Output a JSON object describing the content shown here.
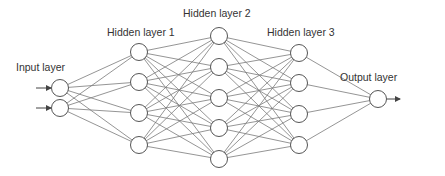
{
  "colors": {
    "background": "#ffffff",
    "node_stroke": "#555555",
    "node_fill": "#ffffff",
    "edge": "#7a7a7a",
    "text": "#333333"
  },
  "layers": [
    {
      "name": "Input layer",
      "x": 60,
      "ys": [
        88,
        108
      ],
      "label_x": 16,
      "label_y": 71
    },
    {
      "name": "Hidden layer 1",
      "x": 139,
      "ys": [
        52,
        82,
        113,
        145
      ],
      "label_x": 107,
      "label_y": 36
    },
    {
      "name": "Hidden layer 2",
      "x": 219,
      "ys": [
        36,
        67,
        98,
        128,
        159
      ],
      "label_x": 183,
      "label_y": 17
    },
    {
      "name": "Hidden layer 3",
      "x": 299,
      "ys": [
        53,
        83,
        114,
        145
      ],
      "label_x": 267,
      "label_y": 36
    },
    {
      "name": "Output layer",
      "x": 378,
      "ys": [
        99
      ],
      "label_x": 340,
      "label_y": 81
    }
  ],
  "node_radius": 8.5,
  "input_arrows": [
    {
      "x1": 36,
      "x2": 51,
      "y": 88
    },
    {
      "x1": 36,
      "x2": 51,
      "y": 108
    }
  ],
  "output_arrow": {
    "x1": 387,
    "x2": 400,
    "y": 99
  }
}
